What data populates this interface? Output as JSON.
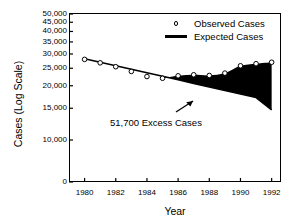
{
  "figure": {
    "background": "#ffffff",
    "ink_color": "#000000"
  },
  "axes": {
    "y_title": "Cases (Log Scale)",
    "x_title": "Year",
    "y_tick_labels": [
      "50,000",
      "45,000",
      "40,000",
      "35,000",
      "30,000",
      "25,000",
      "20,000",
      "15,000",
      "10,000",
      "0"
    ],
    "y_tick_values": [
      50000,
      45000,
      40000,
      35000,
      30000,
      25000,
      20000,
      15000,
      10000,
      0
    ],
    "x_tick_labels": [
      "1980",
      "1982",
      "1984",
      "1986",
      "1988",
      "1990",
      "1992"
    ],
    "x_tick_values": [
      1980,
      1982,
      1984,
      1986,
      1988,
      1990,
      1992
    ]
  },
  "legend": {
    "position": "top-right-inside",
    "entries": [
      {
        "label": "Observed Cases",
        "marker": "open-circle"
      },
      {
        "label": "Expected Cases",
        "marker": "line"
      }
    ]
  },
  "annotation": {
    "text": "51,700 Excess Cases",
    "arrow": "arrow-up-right-icon"
  },
  "chart_data": {
    "type": "line",
    "title": "",
    "xlabel": "Year",
    "ylabel": "Cases (Log Scale)",
    "yscale": "log",
    "ylim": [
      10000,
      50000
    ],
    "xlim": [
      1979,
      1992.6
    ],
    "grid": false,
    "legend_position": "upper right",
    "x": [
      1980,
      1981,
      1982,
      1983,
      1984,
      1985,
      1986,
      1987,
      1988,
      1989,
      1990,
      1991,
      1992
    ],
    "series": [
      {
        "name": "Observed Cases",
        "style": "open-circle-markers",
        "values": [
          28000,
          26800,
          25500,
          24000,
          22500,
          22000,
          22700,
          23000,
          22800,
          23500,
          25800,
          26500,
          27000
        ]
      },
      {
        "name": "Expected Cases",
        "style": "solid-line",
        "values": [
          28200,
          27000,
          25800,
          24700,
          23600,
          22600,
          21600,
          20600,
          19700,
          18800,
          18000,
          17200,
          14700
        ]
      }
    ],
    "shaded_region": {
      "label": "51,700 Excess Cases",
      "between": [
        "Expected Cases",
        "Observed Cases"
      ],
      "x_from": 1985,
      "x_to": 1992,
      "fill": "#000000"
    }
  }
}
